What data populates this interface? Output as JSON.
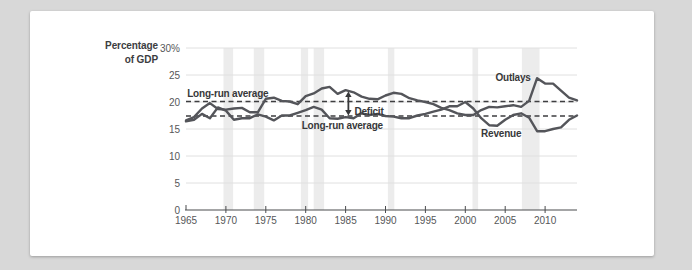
{
  "page": {
    "background_color": "#d8d8d8"
  },
  "card": {
    "background_color": "#ffffff"
  },
  "chart_data": {
    "type": "line",
    "title": "",
    "ylabel": "Percentage of GDP",
    "ylabel_line1": "Percentage",
    "ylabel_line2": "of GDP",
    "xlabel": "",
    "xlim": [
      1965,
      2014
    ],
    "ylim": [
      0,
      30
    ],
    "grid": "horizontal",
    "legend_position": "none",
    "x": [
      1965,
      1966,
      1967,
      1968,
      1969,
      1970,
      1971,
      1972,
      1973,
      1974,
      1975,
      1976,
      1977,
      1978,
      1979,
      1980,
      1981,
      1982,
      1983,
      1984,
      1985,
      1986,
      1987,
      1988,
      1989,
      1990,
      1991,
      1992,
      1993,
      1994,
      1995,
      1996,
      1997,
      1998,
      1999,
      2000,
      2001,
      2002,
      2003,
      2004,
      2005,
      2006,
      2007,
      2008,
      2009,
      2010,
      2011,
      2012,
      2013,
      2014
    ],
    "series": [
      {
        "name": "Outlays",
        "values": [
          16.6,
          17.2,
          18.8,
          19.8,
          18.7,
          18.6,
          18.8,
          18.9,
          18.1,
          18.1,
          20.6,
          20.8,
          20.2,
          20.1,
          19.6,
          21.1,
          21.6,
          22.5,
          22.8,
          21.5,
          22.2,
          21.8,
          21.0,
          20.6,
          20.5,
          21.2,
          21.7,
          21.5,
          20.7,
          20.3,
          20.0,
          19.6,
          18.9,
          18.5,
          17.9,
          17.6,
          17.6,
          18.5,
          19.1,
          19.0,
          19.2,
          19.4,
          19.1,
          20.2,
          24.4,
          23.4,
          23.4,
          22.1,
          20.8,
          20.3
        ]
      },
      {
        "name": "Revenue",
        "values": [
          16.4,
          16.7,
          17.8,
          17.0,
          19.0,
          18.4,
          16.7,
          17.0,
          17.0,
          17.7,
          17.3,
          16.6,
          17.5,
          17.5,
          18.0,
          18.5,
          19.1,
          18.6,
          17.0,
          16.9,
          17.2,
          17.0,
          17.9,
          17.6,
          17.8,
          17.4,
          17.3,
          17.0,
          17.0,
          17.5,
          17.8,
          18.2,
          18.6,
          19.2,
          19.2,
          20.0,
          18.8,
          17.0,
          15.7,
          15.6,
          16.7,
          17.6,
          17.9,
          17.1,
          14.6,
          14.6,
          15.0,
          15.3,
          16.7,
          17.5
        ]
      }
    ],
    "long_run_averages": {
      "outlays": 20.1,
      "revenue": 17.4
    },
    "yticks": [
      {
        "value": 0,
        "label": "0"
      },
      {
        "value": 5,
        "label": "5"
      },
      {
        "value": 10,
        "label": "10"
      },
      {
        "value": 15,
        "label": "15"
      },
      {
        "value": 20,
        "label": "20"
      },
      {
        "value": 25,
        "label": "25"
      },
      {
        "value": 30,
        "label": "30%"
      }
    ],
    "xticks": [
      {
        "value": 1965,
        "label": "1965"
      },
      {
        "value": 1970,
        "label": "1970"
      },
      {
        "value": 1975,
        "label": "1975"
      },
      {
        "value": 1980,
        "label": "1980"
      },
      {
        "value": 1985,
        "label": "1985"
      },
      {
        "value": 1990,
        "label": "1990"
      },
      {
        "value": 1995,
        "label": "1995"
      },
      {
        "value": 2000,
        "label": "2000"
      },
      {
        "value": 2005,
        "label": "2005"
      },
      {
        "value": 2010,
        "label": "2010"
      }
    ],
    "recession_bands": [
      [
        1969.7,
        1970.9
      ],
      [
        1973.5,
        1974.8
      ],
      [
        1979.4,
        1980.3
      ],
      [
        1981.0,
        1982.3
      ],
      [
        1990.3,
        1991.1
      ],
      [
        2000.9,
        2001.6
      ],
      [
        2007.1,
        2009.3
      ]
    ],
    "annotations": [
      {
        "name": "outlays-average-label",
        "text": "Long-run average",
        "year": 1965.15,
        "value": 21.6,
        "anchor": "start"
      },
      {
        "name": "revenue-average-label",
        "text": "Long-run average",
        "year": 1979.5,
        "value": 15.6,
        "anchor": "start"
      },
      {
        "name": "deficit-label",
        "text": "Deficit",
        "year": 1986.1,
        "value": 18.3,
        "anchor": "start"
      },
      {
        "name": "outlays-label",
        "text": "Outlays",
        "year": 2008.2,
        "value": 24.5,
        "anchor": "end"
      },
      {
        "name": "revenue-label",
        "text": "Revenue",
        "year": 2004.5,
        "value": 14.1,
        "anchor": "middle"
      }
    ],
    "deficit_arrow": {
      "year": 1985.35,
      "from_value": 21.95,
      "to_value": 17.5
    },
    "colors": {
      "page_bg": "#d8d8d8",
      "card_bg": "#ffffff",
      "line": "#54555a",
      "average_dash": "#3e3e40",
      "grid": "#e0e0e0",
      "recession_band": "#ececec",
      "axis": "#4b4c4e",
      "tick_text": "#565759",
      "annotation_text": "#37383a"
    }
  }
}
